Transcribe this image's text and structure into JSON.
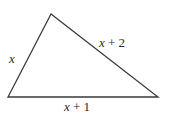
{
  "diagram": {
    "type": "triangle",
    "stroke_color": "#3a3a3a",
    "vertices": {
      "top": [
        51,
        14
      ],
      "bottom_left": [
        8,
        97
      ],
      "bottom_right": [
        158,
        97
      ]
    },
    "labels": {
      "left_side": {
        "var": "x",
        "rest": ""
      },
      "right_side": {
        "var": "x",
        "rest": " + 2"
      },
      "bottom_side": {
        "var": "x",
        "rest": " + 1"
      }
    }
  }
}
